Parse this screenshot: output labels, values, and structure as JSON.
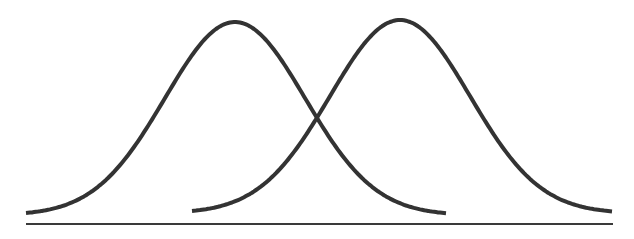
{
  "diagram": {
    "colors": {
      "background": "#ffffff",
      "curve": "#333333",
      "axis": "#3a3a3a"
    },
    "baseline": {
      "x1": 26,
      "x2": 613,
      "y": 224
    },
    "curves": [
      {
        "name": "left-distribution",
        "x_start": 26,
        "x_end": 446,
        "mean_x": 235,
        "sigma_px": 70,
        "peak_y": 22,
        "base_y": 213
      },
      {
        "name": "right-distribution",
        "x_start": 192,
        "x_end": 613,
        "mean_x": 400,
        "sigma_px": 70,
        "peak_y": 20,
        "base_y": 211
      }
    ],
    "intersection": {
      "x": 318,
      "y": 77
    }
  }
}
